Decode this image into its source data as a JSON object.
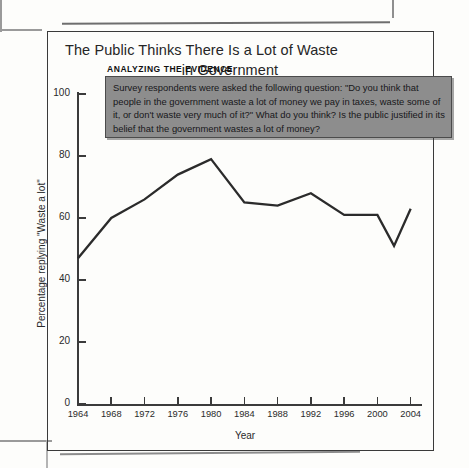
{
  "figure": {
    "title_line1": "The Public Thinks There Is a Lot of Waste",
    "title_line2": "in Government"
  },
  "callout": {
    "heading": "ANALYZING THE EVIDENCE",
    "text": "Survey respondents were asked the following question: \"Do you think that people in the government waste a lot of money we pay in taxes, waste some of it, or don't waste very much of it?\" What do you think? Is the public justified in its belief that the government wastes a lot of money?",
    "background_color": "#8d8d8d",
    "border_color": "#4b4b4b"
  },
  "chart_data": {
    "type": "line",
    "title": "The Public Thinks There Is a Lot of Waste in Government",
    "xlabel": "Year",
    "ylabel": "Percentage replying \"Waste a lot\"",
    "x": [
      1964,
      1968,
      1972,
      1976,
      1980,
      1984,
      1988,
      1992,
      1996,
      2000,
      2002,
      2004
    ],
    "values": [
      47,
      60,
      66,
      74,
      79,
      65,
      64,
      68,
      61,
      61,
      51,
      63
    ],
    "xlim": [
      1964,
      2005
    ],
    "ylim": [
      0,
      100
    ],
    "ytick_labels": [
      "0",
      "20",
      "40",
      "60",
      "80",
      "100"
    ],
    "ytick_values": [
      0,
      20,
      40,
      60,
      80,
      100
    ],
    "xtick_labels": [
      "1964",
      "1968",
      "1972",
      "1976",
      "1980",
      "1984",
      "1988",
      "1992",
      "1996",
      "2000",
      "2004"
    ],
    "xtick_values": [
      1964,
      1968,
      1972,
      1976,
      1980,
      1984,
      1988,
      1992,
      1996,
      2000,
      2004
    ],
    "grid": false,
    "legend": null,
    "line_color": "#2b2b2b"
  }
}
